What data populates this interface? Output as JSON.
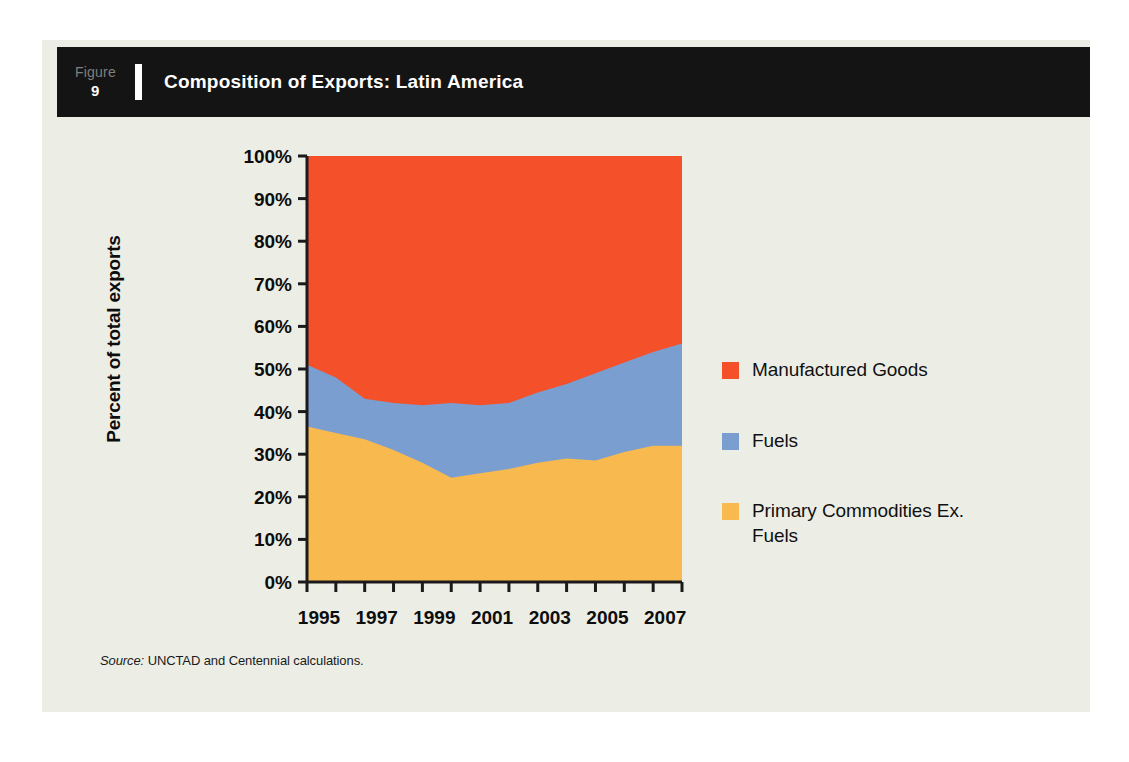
{
  "figure": {
    "label_word": "Figure",
    "number": "9",
    "title": "Composition of Exports: Latin America"
  },
  "source": {
    "prefix": "Source:",
    "text": "UNCTAD and Centennial calculations."
  },
  "legend": {
    "items": [
      {
        "label": "Manufactured Goods",
        "color": "#F4502A"
      },
      {
        "label": "Fuels",
        "color": "#7B9ED1"
      },
      {
        "label": "Primary Commodities Ex. Fuels",
        "color": "#F8B košer"
      }
    ]
  },
  "colors": {
    "panel_background": "#eceee6",
    "header_background": "#141414",
    "manufactured_goods": "#F4502A",
    "fuels": "#7B9ED1",
    "primary_commodities": "#F8B94F",
    "axis": "#1a1a1a"
  },
  "chart_data": {
    "type": "area",
    "stacked": true,
    "title": "Composition of Exports: Latin America",
    "xlabel": "",
    "ylabel": "Percent of total exports",
    "ylim": [
      0,
      100
    ],
    "xlim": [
      1995,
      2008
    ],
    "grid": false,
    "legend_position": "right",
    "y_ticks": [
      "0%",
      "10%",
      "20%",
      "30%",
      "40%",
      "50%",
      "60%",
      "70%",
      "80%",
      "90%",
      "100%"
    ],
    "y_tick_values": [
      0,
      10,
      20,
      30,
      40,
      50,
      60,
      70,
      80,
      90,
      100
    ],
    "x_tick_values": [
      1995,
      1996,
      1997,
      1998,
      1999,
      2000,
      2001,
      2002,
      2003,
      2004,
      2005,
      2006,
      2007,
      2008
    ],
    "x_tick_labels": [
      "1995",
      "1997",
      "1999",
      "2001",
      "2003",
      "2005",
      "2007"
    ],
    "x_tick_label_values": [
      1995,
      1997,
      1999,
      2001,
      2003,
      2005,
      2007
    ],
    "x": [
      1995,
      1996,
      1997,
      1998,
      1999,
      2000,
      2001,
      2002,
      2003,
      2004,
      2005,
      2006,
      2007,
      2008
    ],
    "series": [
      {
        "name": "Primary Commodities Ex. Fuels",
        "color": "#F8B94F",
        "values": [
          36.5,
          35.0,
          33.5,
          31.0,
          28.0,
          24.5,
          25.5,
          26.5,
          28.0,
          29.0,
          28.5,
          30.5,
          32.0,
          32.0
        ]
      },
      {
        "name": "Fuels",
        "color": "#7B9ED1",
        "values": [
          14.5,
          13.0,
          9.5,
          11.0,
          13.5,
          17.5,
          16.0,
          15.5,
          16.5,
          17.5,
          20.5,
          21.0,
          22.0,
          24.0
        ]
      },
      {
        "name": "Manufactured Goods",
        "color": "#F4502A",
        "values": [
          49.0,
          52.0,
          57.0,
          58.0,
          58.5,
          58.0,
          58.5,
          58.0,
          55.5,
          53.5,
          51.0,
          48.5,
          46.0,
          44.0
        ]
      }
    ],
    "cumulative_top_boundaries": {
      "primary_commodities_top": [
        36.5,
        35.0,
        33.5,
        31.0,
        28.0,
        24.5,
        25.5,
        26.5,
        28.0,
        29.0,
        28.5,
        30.5,
        32.0,
        32.0
      ],
      "fuels_top": [
        51.0,
        48.0,
        43.0,
        42.0,
        41.5,
        42.0,
        41.5,
        42.0,
        44.5,
        46.5,
        49.0,
        51.5,
        54.0,
        56.0
      ],
      "manufactured_top": [
        100,
        100,
        100,
        100,
        100,
        100,
        100,
        100,
        100,
        100,
        100,
        100,
        100,
        100
      ]
    }
  }
}
